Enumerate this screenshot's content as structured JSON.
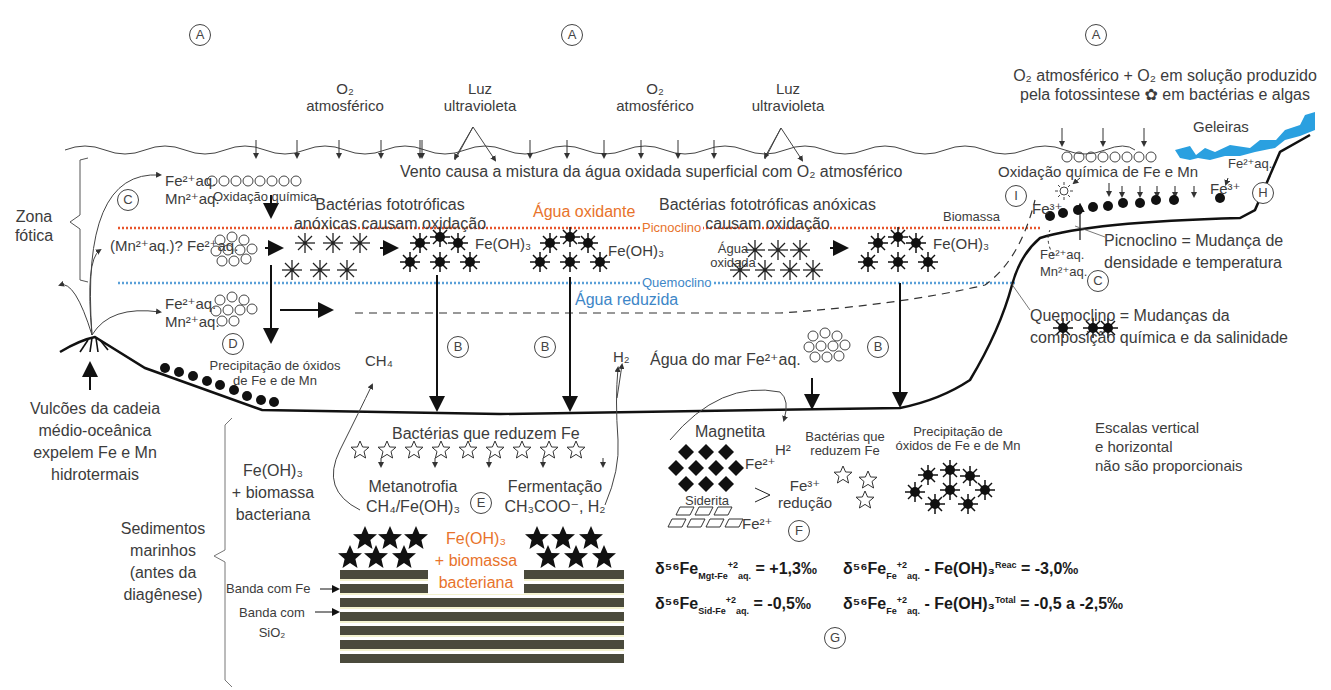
{
  "markers": {
    "A": "A",
    "B": "B",
    "C": "C",
    "D": "D",
    "E": "E",
    "F": "F",
    "G": "G",
    "H": "H",
    "I": "I"
  },
  "atmosphere": {
    "o2_atmosferico_1": {
      "line1": "O₂",
      "line2": "atmosférico"
    },
    "luz_uv_1": {
      "line1": "Luz",
      "line2": "ultravioleta"
    },
    "o2_atmosferico_2": {
      "line1": "O₂",
      "line2": "atmosférico"
    },
    "luz_uv_2": {
      "line1": "Luz",
      "line2": "ultravioleta"
    },
    "o2_photosynthesis": {
      "line1": "O₂ atmosférico + O₂ em solução produzido",
      "line2": "pela fotossintese ✿ em bactérias e algas"
    },
    "geleiras": "Geleiras"
  },
  "surface": {
    "wind_mixing": "Vento causa a mistura da água oxidada superficial com O₂ atmosférico",
    "oxidacao_quimica": "Oxidação química",
    "oxidacao_quimica_fe_mn": "Oxidação química de Fe e Mn",
    "fe_aq": "Fe²⁺aq.",
    "mn_aq": "Mn²⁺aq.",
    "fe3": "Fe³⁺",
    "biomassa": "Biomassa"
  },
  "zones": {
    "zona_fotica": {
      "line1": "Zona",
      "line2": "fótica"
    },
    "agua_oxidante": "Água oxidante",
    "picnoclino": "Picnoclino",
    "quemoclino": "Quemoclino",
    "agua_reduzida": "Água reduzida",
    "agua_oxidada": {
      "line1": "Água",
      "line2": "oxidada"
    },
    "agua_do_mar": "Água do mar Fe²⁺aq."
  },
  "bacteria_labels": {
    "left": {
      "line1": "Bactérias fototróficas",
      "line2": "anóxicas causam oxidação"
    },
    "right": {
      "line1": "Bactérias fototróficas anóxicas",
      "line2": "causam oxidação"
    }
  },
  "precipitates": {
    "fe_oh3": "Fe(OH)₃",
    "mn_question": "(Mn²⁺aq.)? Fe²⁺aq.",
    "precip_oxides": {
      "line1": "Precipitação de óxidos",
      "line2": "de Fe e de Mn"
    },
    "precip_oxides_right": {
      "line1": "Precipitação de",
      "line2": "óxidos de Fe e de Mn"
    },
    "ch4": "CH₄",
    "h2": "H₂"
  },
  "definitions": {
    "picnoclino": {
      "line1": "Picnoclino = Mudança de",
      "line2": "densidade e temperatura"
    },
    "quemoclino": {
      "line1": "Quemoclino = Mudanças da",
      "line2": "composição química e da salinidade"
    }
  },
  "volcano": {
    "line1": "Vulcões da cadeia",
    "line2": "médio-oceânica",
    "line3": "expelem Fe e Mn",
    "line4": "hidrotermais"
  },
  "sediments": {
    "fe_oh3_biomass": {
      "line1": "Fe(OH)₃",
      "line2": "+ biomassa",
      "line3": "bacteriana"
    },
    "sedimentos": {
      "line1": "Sedimentos",
      "line2": "marinhos",
      "line3": "(antes da",
      "line4": "diagênese)"
    },
    "banda_fe": "Banda com Fe",
    "banda_sio2": {
      "line1": "Banda com",
      "line2": "SiO₂"
    },
    "center_label": {
      "line1": "Fe(OH)₃",
      "line2": "+ biomassa",
      "line3": "bacteriana"
    }
  },
  "reduction": {
    "bacterias_reduzem": "Bactérias que reduzem Fe",
    "metanotrofia": {
      "line1": "Metanotrofia",
      "line2": "CH₄/Fe(OH)₃"
    },
    "fermentacao": {
      "line1": "Fermentação",
      "line2": "CH₃COO⁻, H₂"
    },
    "magnetita": "Magnetita",
    "h2_sup": "H²",
    "fe2_a": "Fe²⁺",
    "fe2_b": "Fe²⁺",
    "siderita": "Siderita",
    "fe3_reducao": {
      "line1": "Fe³⁺",
      "line2": "redução"
    },
    "bacterias_reduzem_small": {
      "line1": "Bactérias que",
      "line2": "reduzem Fe"
    }
  },
  "scale_note": {
    "line1": "Escalas vertical",
    "line2": "e horizontal",
    "line3": "não são proporcionais"
  },
  "isotopes": {
    "eq1": {
      "prefix": "δ⁵⁶Fe",
      "sub": "Mgt-Fe",
      "sup": "+2",
      "sub2": "aq.",
      "value": "= +1,3‰"
    },
    "eq2": {
      "prefix": "δ⁵⁶Fe",
      "sub": "Fe",
      "sup": "+2",
      "sub2": "aq.",
      "mid": " - Fe(OH)₃",
      "sup2": "Reac",
      "value": "= -3,0‰"
    },
    "eq3": {
      "prefix": "δ⁵⁶Fe",
      "sub": "Sid-Fe",
      "sup": "+2",
      "sub2": "aq.",
      "value": "= -0,5‰"
    },
    "eq4": {
      "prefix": "δ⁵⁶Fe",
      "sub": "Fe",
      "sup": "+2",
      "sub2": "aq.",
      "mid": " - Fe(OH)₃",
      "sup2": "Total",
      "value": "= -0,5 a -2,5‰"
    }
  },
  "colors": {
    "picnoclino_line": "#e8552b",
    "quemoclino_line": "#5aa0d8",
    "agua_oxidante": "#e8732b",
    "agua_reduzida": "#3d86c7",
    "glacier": "#2aa0e0",
    "sediment_band": "#4a4a3c",
    "sediment_gap": "#e8e6a0"
  }
}
